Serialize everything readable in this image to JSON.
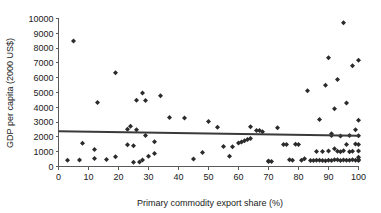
{
  "chart_data": {
    "type": "scatter",
    "title": "",
    "xlabel": "Primary commodity export share (%)",
    "ylabel": "GDP per capita (2000 US$)",
    "xlim": [
      0,
      100
    ],
    "ylim": [
      0,
      10000
    ],
    "xticks": [
      0,
      10,
      20,
      30,
      40,
      50,
      60,
      70,
      80,
      90,
      100
    ],
    "yticks": [
      0,
      1000,
      2000,
      3000,
      4000,
      5000,
      6000,
      7000,
      8000,
      9000,
      10000
    ],
    "grid": false,
    "legend": "none",
    "marker_color": "#2b2b2b",
    "marker_shape": "diamond",
    "trend_line": {
      "label": "linear fit",
      "color": "#3a3a3a",
      "x_start": 0,
      "y_start": 2380,
      "x_end": 100,
      "y_end": 2080
    },
    "series": [
      {
        "name": "Countries",
        "points": [
          [
            3,
            420
          ],
          [
            5,
            8480
          ],
          [
            7,
            440
          ],
          [
            8,
            1570
          ],
          [
            12,
            540
          ],
          [
            12,
            1150
          ],
          [
            13,
            4320
          ],
          [
            16,
            470
          ],
          [
            19,
            660
          ],
          [
            19,
            6330
          ],
          [
            23,
            1470
          ],
          [
            23,
            2520
          ],
          [
            24,
            2720
          ],
          [
            25,
            1400
          ],
          [
            25,
            280
          ],
          [
            26,
            2480
          ],
          [
            26,
            4480
          ],
          [
            27,
            300
          ],
          [
            28,
            4960
          ],
          [
            28,
            440
          ],
          [
            29,
            2100
          ],
          [
            29,
            4460
          ],
          [
            30,
            690
          ],
          [
            32,
            1670
          ],
          [
            32,
            880
          ],
          [
            34,
            4780
          ],
          [
            37,
            3310
          ],
          [
            42,
            3270
          ],
          [
            45,
            500
          ],
          [
            48,
            950
          ],
          [
            50,
            3040
          ],
          [
            53,
            2660
          ],
          [
            55,
            1350
          ],
          [
            57,
            700
          ],
          [
            58,
            1330
          ],
          [
            60,
            1580
          ],
          [
            61,
            1650
          ],
          [
            62,
            1740
          ],
          [
            63,
            1830
          ],
          [
            64,
            1900
          ],
          [
            64,
            2690
          ],
          [
            66,
            2440
          ],
          [
            67,
            2430
          ],
          [
            68,
            2350
          ],
          [
            70,
            370
          ],
          [
            70,
            330
          ],
          [
            71,
            340
          ],
          [
            73,
            2610
          ],
          [
            75,
            1490
          ],
          [
            76,
            1480
          ],
          [
            77,
            450
          ],
          [
            78,
            420
          ],
          [
            79,
            1500
          ],
          [
            80,
            1490
          ],
          [
            81,
            430
          ],
          [
            82,
            530
          ],
          [
            83,
            5110
          ],
          [
            84,
            410
          ],
          [
            85,
            400
          ],
          [
            86,
            1010
          ],
          [
            86,
            430
          ],
          [
            87,
            430
          ],
          [
            87,
            3170
          ],
          [
            88,
            1020
          ],
          [
            88,
            410
          ],
          [
            89,
            5490
          ],
          [
            89,
            390
          ],
          [
            90,
            1050
          ],
          [
            90,
            7340
          ],
          [
            90,
            420
          ],
          [
            91,
            2220
          ],
          [
            91,
            2090
          ],
          [
            91,
            410
          ],
          [
            92,
            1200
          ],
          [
            92,
            450
          ],
          [
            92,
            3910
          ],
          [
            93,
            460
          ],
          [
            93,
            1030
          ],
          [
            93,
            5880
          ],
          [
            94,
            400
          ],
          [
            94,
            1000
          ],
          [
            94,
            2060
          ],
          [
            95,
            440
          ],
          [
            95,
            1070
          ],
          [
            95,
            9720
          ],
          [
            96,
            420
          ],
          [
            96,
            1480
          ],
          [
            96,
            4290
          ],
          [
            97,
            430
          ],
          [
            97,
            990
          ],
          [
            97,
            2090
          ],
          [
            98,
            450
          ],
          [
            98,
            1030
          ],
          [
            98,
            6810
          ],
          [
            99,
            420
          ],
          [
            99,
            1520
          ],
          [
            99,
            2490
          ],
          [
            100,
            410
          ],
          [
            100,
            1050
          ],
          [
            100,
            7180
          ],
          [
            100,
            480
          ],
          [
            100,
            1490
          ],
          [
            100,
            3130
          ],
          [
            100,
            2080
          ],
          [
            100,
            620
          ]
        ]
      }
    ]
  },
  "axes": {
    "x_tick_labels": [
      "0",
      "10",
      "20",
      "30",
      "40",
      "50",
      "60",
      "70",
      "80",
      "90",
      "100"
    ],
    "y_tick_labels": [
      "0",
      "1000",
      "2000",
      "3000",
      "4000",
      "5000",
      "6000",
      "7000",
      "8000",
      "9000",
      "10000"
    ]
  }
}
